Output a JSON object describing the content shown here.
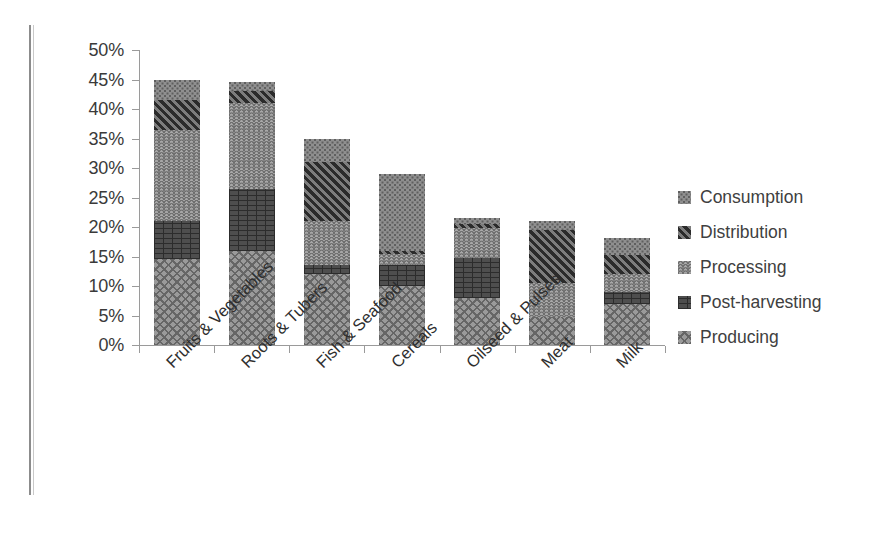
{
  "chart_data": {
    "type": "bar",
    "subtype": "stacked-vertical",
    "title": "",
    "xlabel": "",
    "ylabel": "",
    "ylim": [
      0,
      50
    ],
    "y_unit": "%",
    "y_tick_labels": [
      "50%",
      "45%",
      "40%",
      "35%",
      "30%",
      "25%",
      "20%",
      "15%",
      "10%",
      "5%",
      "0%"
    ],
    "y_tick_values": [
      50,
      45,
      40,
      35,
      30,
      25,
      20,
      15,
      10,
      5,
      0
    ],
    "grid": false,
    "legend_position": "right",
    "categories": [
      "Fruits & Vegetables",
      "Roots & Tubers",
      "Fish & Seafood",
      "Cereals",
      "Oilseed & Pulses",
      "Meat",
      "Milk"
    ],
    "series": [
      {
        "name": "Producing",
        "pattern": "diagonal-cross-hatch",
        "color": "#9a9a9a",
        "values": [
          14.5,
          16.0,
          12.0,
          10.0,
          8.0,
          4.8,
          7.0
        ]
      },
      {
        "name": "Post-harvesting",
        "pattern": "brick",
        "color": "#4e4e4e",
        "values": [
          6.5,
          10.5,
          1.5,
          3.5,
          6.8,
          0.0,
          2.0
        ]
      },
      {
        "name": "Processing",
        "pattern": "zigzag-wave",
        "color": "#a8a8a8",
        "values": [
          15.5,
          14.5,
          7.5,
          2.0,
          5.0,
          5.7,
          3.0
        ]
      },
      {
        "name": "Distribution",
        "pattern": "diagonal-stripe-dark",
        "color": "#3b3b3b",
        "values": [
          5.0,
          2.0,
          10.0,
          0.5,
          0.7,
          9.0,
          3.3
        ]
      },
      {
        "name": "Consumption",
        "pattern": "dotted",
        "color": "#8f8f8f",
        "values": [
          3.5,
          1.5,
          4.0,
          13.0,
          1.0,
          1.5,
          2.9
        ]
      }
    ],
    "category_totals": [
      45.0,
      45.0,
      35.0,
      29.0,
      21.5,
      21.0,
      18.2
    ]
  },
  "legend": {
    "items": [
      {
        "label": "Consumption",
        "key": "consumption-swatch"
      },
      {
        "label": "Distribution",
        "key": "distribution-swatch"
      },
      {
        "label": "Processing",
        "key": "processing-swatch"
      },
      {
        "label": "Post-harvesting",
        "key": "postharvesting-swatch"
      },
      {
        "label": "Producing",
        "key": "producing-swatch"
      }
    ]
  }
}
